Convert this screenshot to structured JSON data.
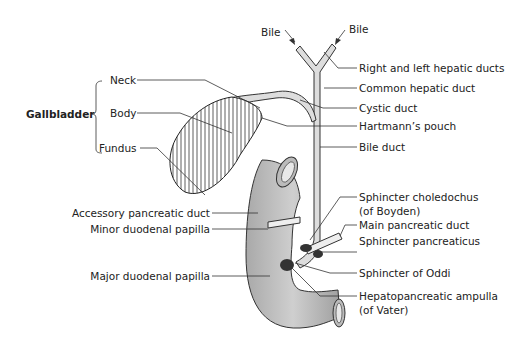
{
  "diagram": {
    "group_label": "Gallbladder",
    "gallbladder_parts": [
      "Neck",
      "Body",
      "Fundus"
    ],
    "bile_arrows": [
      "Bile",
      "Bile"
    ],
    "right_labels": [
      "Right and left hepatic ducts",
      "Common hepatic duct",
      "Cystic duct",
      "Hartmann’s pouch",
      "Bile duct",
      "Sphincter choledochus",
      "(of Boyden)",
      "Main pancreatic duct",
      "Sphincter pancreaticus",
      "Sphincter of Oddi",
      "Hepatopancreatic ampulla",
      "(of Vater)"
    ],
    "left_labels": [
      "Accessory pancreatic duct",
      "Minor duodenal papilla",
      "Major duodenal papilla"
    ]
  }
}
